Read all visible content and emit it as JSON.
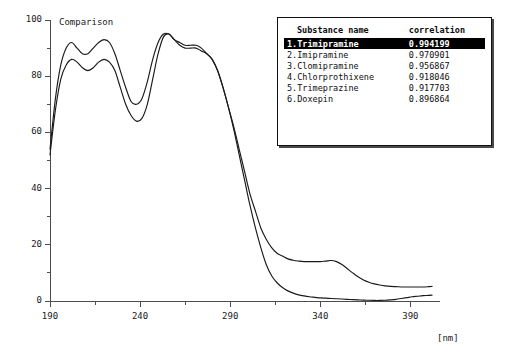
{
  "chart_data": {
    "type": "line",
    "title": "Comparison",
    "xlabel": "[nm]",
    "ylabel": "",
    "xlim": [
      190,
      402
    ],
    "ylim": [
      0,
      100
    ],
    "xticks": [
      190,
      240,
      290,
      340,
      390
    ],
    "yticks": [
      0,
      20,
      40,
      60,
      80,
      100
    ],
    "xminor_step": 25,
    "yminor_step": 10,
    "grid": false,
    "legend_position": "top-right",
    "x": [
      190,
      193,
      196,
      199,
      202,
      205,
      208,
      211,
      214,
      217,
      220,
      223,
      226,
      229,
      232,
      235,
      238,
      241,
      244,
      247,
      250,
      253,
      256,
      259,
      262,
      265,
      268,
      271,
      274,
      277,
      280,
      283,
      286,
      289,
      292,
      295,
      298,
      301,
      304,
      307,
      310,
      313,
      316,
      319,
      322,
      325,
      328,
      331,
      334,
      337,
      340,
      343,
      346,
      349,
      352,
      355,
      358,
      361,
      364,
      367,
      370,
      373,
      376,
      379,
      382,
      385,
      388,
      391,
      394,
      397,
      400,
      402
    ],
    "series": [
      {
        "name": "reference-spectrum-upper",
        "color": "#1a1a1a",
        "values": [
          54,
          72,
          84,
          90,
          92,
          90,
          88,
          88,
          90,
          92,
          93,
          92,
          88,
          82,
          76,
          71,
          70,
          72,
          78,
          86,
          92,
          95,
          95,
          93,
          91,
          90,
          90,
          90,
          89,
          88,
          86,
          82,
          76,
          69,
          62,
          54,
          46,
          38,
          32,
          26,
          22,
          19,
          17,
          16,
          15,
          14.5,
          14.2,
          14,
          14,
          14,
          14,
          14.2,
          14.4,
          14,
          13,
          11.5,
          10,
          8.6,
          7.5,
          6.7,
          6.1,
          5.7,
          5.4,
          5.2,
          5.1,
          5,
          5,
          5,
          5,
          5,
          5.1,
          5.2
        ]
      },
      {
        "name": "sample-spectrum-lower",
        "color": "#1a1a1a",
        "values": [
          52,
          68,
          79,
          84,
          86,
          85,
          83,
          82,
          83,
          85,
          86,
          85,
          82,
          76,
          70,
          66,
          64,
          65,
          70,
          79,
          88,
          94,
          95,
          93,
          92,
          91,
          91,
          91,
          90,
          88,
          86,
          82,
          76,
          69,
          61,
          52,
          43,
          34,
          26,
          19,
          13,
          9,
          6.5,
          4.8,
          3.6,
          2.8,
          2.2,
          1.8,
          1.5,
          1.3,
          1.1,
          1,
          0.9,
          0.8,
          0.7,
          0.6,
          0.5,
          0.4,
          0.3,
          0.25,
          0.2,
          0.2,
          0.25,
          0.4,
          0.6,
          0.9,
          1.2,
          1.5,
          1.7,
          1.9,
          2.0,
          2.1
        ]
      }
    ]
  },
  "legend": {
    "headers": {
      "name": "Substance name",
      "correlation": "correlation"
    },
    "rows": [
      {
        "label": "1.Trimipramine",
        "correlation": "0.994199",
        "selected": true
      },
      {
        "label": "2.Imipramine",
        "correlation": "0.970901",
        "selected": false
      },
      {
        "label": "3.Clomipramine",
        "correlation": "0.956867",
        "selected": false
      },
      {
        "label": "4.Chlorprothixene",
        "correlation": "0.918046",
        "selected": false
      },
      {
        "label": "5.Trimeprazine",
        "correlation": "0.917703",
        "selected": false
      },
      {
        "label": "6.Doxepin",
        "correlation": "0.896864",
        "selected": false
      }
    ]
  },
  "colors": {
    "curve": "#1a1a1a",
    "axis": "#4d4d4d",
    "text": "#1a1a1a",
    "legend_border": "#111111",
    "legend_shadow": "#4a4a4a",
    "selected_bg": "#000000",
    "selected_fg": "#ffffff"
  }
}
